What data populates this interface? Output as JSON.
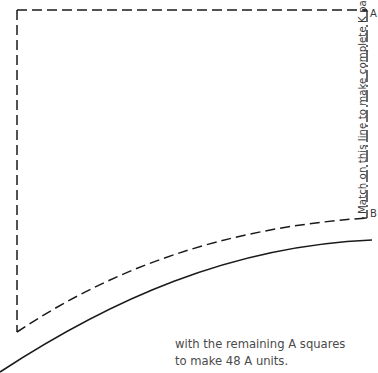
{
  "pattern": {
    "match_line_label": "Match on this line to make complete K pattern",
    "corner_top": "A",
    "corner_bottom": "B",
    "stroke_color": "#1a1a1a"
  },
  "caption": {
    "line1": "with the remaining A squares",
    "line2": "to make 48 A units."
  }
}
